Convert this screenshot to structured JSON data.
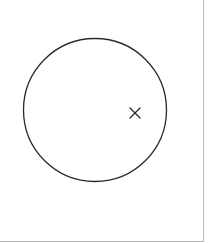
{
  "diagram": {
    "type": "circle-with-marked-point",
    "circle": {
      "cx": 95,
      "cy": 110,
      "r": 71.5,
      "stroke": "#2a2a2a"
    },
    "marker": {
      "symbol": "x",
      "cx": 135,
      "cy": 113,
      "size": 5,
      "stroke": "#2a2a2a"
    },
    "frame_color": "#b8b8b8",
    "background": "#ffffff"
  }
}
